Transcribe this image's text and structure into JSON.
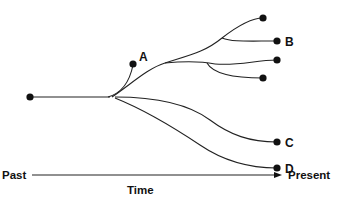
{
  "diagram": {
    "type": "phylogenetic-tree",
    "tips": [
      {
        "id": "A",
        "label": "A"
      },
      {
        "id": "top",
        "label": ""
      },
      {
        "id": "B",
        "label": "B"
      },
      {
        "id": "mid",
        "label": ""
      },
      {
        "id": "low",
        "label": ""
      },
      {
        "id": "C",
        "label": "C"
      },
      {
        "id": "D",
        "label": "D"
      }
    ],
    "axis": {
      "start_label": "Past",
      "end_label": "Present",
      "title": "Time"
    }
  }
}
